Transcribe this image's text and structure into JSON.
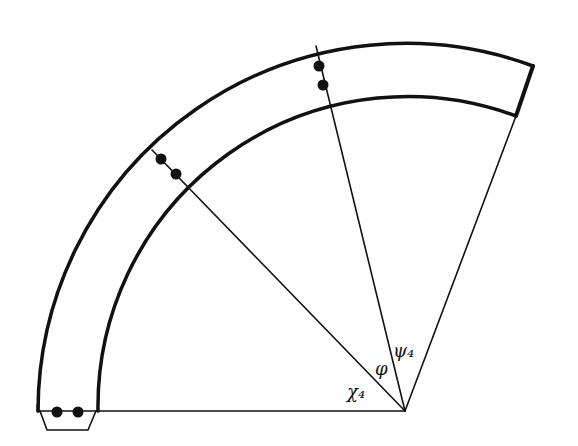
{
  "diagram": {
    "labels": {
      "chi": "χ₄",
      "phi": "φ",
      "psi": "ψ₄"
    },
    "colors": {
      "stroke": "#111111",
      "background": "#ffffff"
    }
  }
}
